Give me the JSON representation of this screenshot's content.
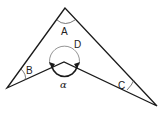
{
  "diagram": {
    "type": "concave-quadrilateral",
    "colors": {
      "stroke": "#1a1a1a",
      "arc": "#555555",
      "background": "#ffffff"
    },
    "vertices": {
      "top": [
        65,
        8
      ],
      "left": [
        7,
        88
      ],
      "inner": [
        64,
        62
      ],
      "right": [
        157,
        106
      ]
    },
    "labels": {
      "A": "A",
      "B": "B",
      "C": "C",
      "D": "D",
      "alpha": "α"
    }
  }
}
